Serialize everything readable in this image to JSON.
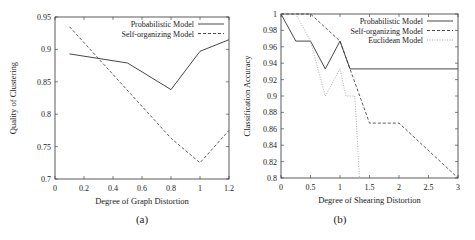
{
  "chart_data": [
    {
      "type": "line",
      "panel_label": "(a)",
      "title": "",
      "xlabel": "Degree of Graph Distortion",
      "ylabel": "Quality of Clustering",
      "xlim": [
        0,
        1.2
      ],
      "ylim": [
        0.7,
        0.95
      ],
      "xticks": [
        "0",
        "0.2",
        "0.4",
        "0.6",
        "0.8",
        "1",
        "1.2"
      ],
      "yticks": [
        "0.7",
        "0.75",
        "0.8",
        "0.85",
        "0.9",
        "0.95"
      ],
      "legend_position": "top-right",
      "grid": false,
      "series": [
        {
          "name": "Probabilistic Model",
          "style": "solid",
          "x": [
            0.1,
            0.5,
            0.8,
            1.0,
            1.2
          ],
          "y": [
            0.893,
            0.879,
            0.838,
            0.897,
            0.915
          ]
        },
        {
          "name": "Self-organizing Model",
          "style": "dashed",
          "x": [
            0.1,
            0.8,
            1.0,
            1.2
          ],
          "y": [
            0.935,
            0.763,
            0.725,
            0.775
          ]
        }
      ]
    },
    {
      "type": "line",
      "panel_label": "(b)",
      "title": "",
      "xlabel": "Degree of Shearing Distortion",
      "ylabel": "Classification Accuracy",
      "xlim": [
        0,
        3
      ],
      "ylim": [
        0.8,
        1.0
      ],
      "xticks": [
        "0",
        "0.5",
        "1",
        "1.5",
        "2",
        "2.5",
        "3"
      ],
      "yticks": [
        "0.8",
        "0.82",
        "0.84",
        "0.86",
        "0.88",
        "0.9",
        "0.92",
        "0.94",
        "0.96",
        "0.98",
        "1"
      ],
      "legend_position": "top-right",
      "grid": false,
      "series": [
        {
          "name": "Probabilistic Model",
          "style": "solid",
          "x": [
            0,
            0.25,
            0.5,
            0.75,
            1.0,
            1.17,
            3.0
          ],
          "y": [
            1.0,
            0.967,
            0.967,
            0.933,
            0.967,
            0.933,
            0.933
          ]
        },
        {
          "name": "Self-organizing Model",
          "style": "dashed",
          "x": [
            0,
            0.5,
            1.0,
            1.5,
            2.0,
            3.0
          ],
          "y": [
            1.0,
            1.0,
            0.967,
            0.867,
            0.867,
            0.8
          ]
        },
        {
          "name": "Euclidean Model",
          "style": "dotted",
          "x": [
            0,
            0.25,
            0.5,
            0.75,
            1.0,
            1.1,
            1.25,
            1.33
          ],
          "y": [
            1.0,
            1.0,
            0.967,
            0.9,
            0.933,
            0.9,
            0.9,
            0.8
          ]
        }
      ]
    }
  ]
}
